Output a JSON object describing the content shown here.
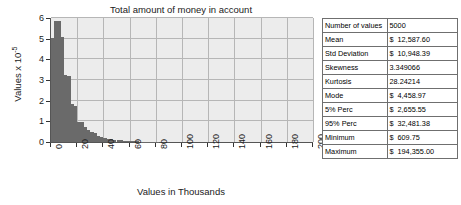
{
  "chart_data": {
    "type": "bar",
    "title": "Total amount of money in account",
    "xlabel": "Values in Thousands",
    "ylabel": "Values x 10-5",
    "ylabel_display": "Values x 10",
    "ylabel_exponent": "-5",
    "xlim": [
      0,
      200
    ],
    "ylim": [
      0,
      6
    ],
    "grid": true,
    "legend": "none",
    "bin_width": 2.5,
    "x_ticks": [
      0,
      20,
      40,
      60,
      80,
      100,
      120,
      140,
      160,
      180,
      200
    ],
    "y_ticks": [
      0,
      1,
      2,
      3,
      4,
      5,
      6
    ],
    "bin_starts": [
      0,
      2.5,
      5,
      7.5,
      10,
      12.5,
      15,
      17.5,
      20,
      22.5,
      25,
      27.5,
      30,
      32.5,
      35,
      37.5,
      40,
      42.5,
      45,
      47.5,
      50,
      52.5,
      55,
      57.5,
      60,
      62.5,
      65,
      67.5,
      70,
      72.5,
      75,
      77.5,
      80
    ],
    "values": [
      5.05,
      5.85,
      5.85,
      5.1,
      3.25,
      3.2,
      1.85,
      1.75,
      0.98,
      0.95,
      0.72,
      0.6,
      0.5,
      0.42,
      0.3,
      0.26,
      0.2,
      0.17,
      0.14,
      0.12,
      0.1,
      0.08,
      0.07,
      0.05,
      0.04,
      0.03,
      0.03,
      0.02,
      0.02,
      0.01,
      0.01,
      0.01,
      0.01
    ],
    "bar_color": "#6a6a6a",
    "plot_background": "#ececec",
    "grid_color": "#b6b6b6"
  },
  "stats": {
    "rows": [
      {
        "label": "Number of values",
        "currency": "",
        "value": "5000"
      },
      {
        "label": "Mean",
        "currency": "$",
        "value": "12,587.60"
      },
      {
        "label": "Std Deviation",
        "currency": "$",
        "value": "10,948.39"
      },
      {
        "label": "Skewness",
        "currency": "",
        "value": "3.349066"
      },
      {
        "label": "Kurtosis",
        "currency": "",
        "value": "28.24214"
      },
      {
        "label": "Mode",
        "currency": "$",
        "value": "4,458.97"
      },
      {
        "label": "5% Perc",
        "currency": "$",
        "value": "2,655.55"
      },
      {
        "label": "95% Perc",
        "currency": "$",
        "value": "32,481.38"
      },
      {
        "label": "Minimum",
        "currency": "$",
        "value": "609.75"
      },
      {
        "label": "Maximum",
        "currency": "$",
        "value": "194,355.00"
      }
    ]
  }
}
